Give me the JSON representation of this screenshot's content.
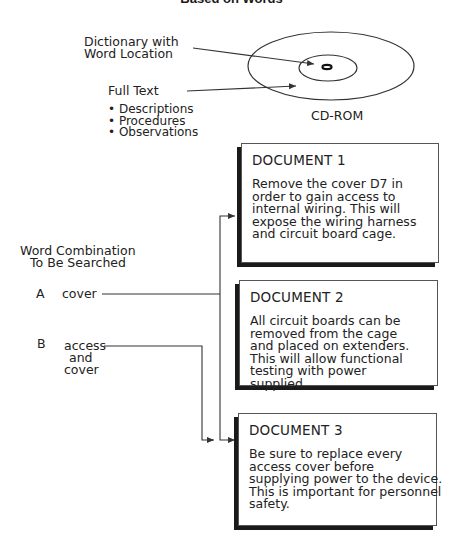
{
  "title": "Based on Words",
  "cdrom": {
    "label": "CD-ROM",
    "dictionary_label_line1": "Dictionary with",
    "dictionary_label_line2": "Word Location",
    "fulltext_label": "Full Text",
    "fulltext_items": [
      "Descriptions",
      "Procedures",
      "Observations"
    ]
  },
  "search": {
    "heading_line1": "Word Combination",
    "heading_line2": "To Be Searched",
    "combinations": [
      {
        "letter": "A",
        "words": [
          "cover"
        ]
      },
      {
        "letter": "B",
        "words": [
          "access",
          "and",
          "cover"
        ]
      }
    ]
  },
  "documents": [
    {
      "title": "DOCUMENT 1",
      "body": "Remove the cover D7 in\norder to gain access to\ninternal wiring. This will\nexpose the wiring harness\nand circuit board cage."
    },
    {
      "title": "DOCUMENT 2",
      "body": "All circuit boards can be\nremoved from the cage\nand placed on extenders.\nThis will allow functional\ntesting with power\nsupplied."
    },
    {
      "title": "DOCUMENT 3",
      "body": "Be sure to replace every\naccess cover before\nsupplying power to the device.\nThis is important for personnel\nsafety."
    }
  ],
  "colors": {
    "line": "#333333",
    "shadow": "#1a1a1a",
    "border": "#555555"
  }
}
